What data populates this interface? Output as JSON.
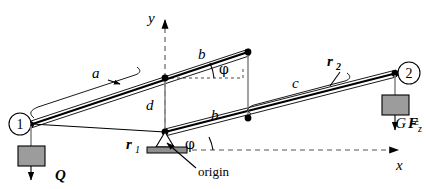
{
  "figure": {
    "axes": {
      "y_label": "y",
      "x_label": "x",
      "origin_label": "origin"
    },
    "nodes": [
      {
        "id": "node-1",
        "label": "1",
        "x": 24,
        "y": 124
      },
      {
        "id": "node-2",
        "label": "2",
        "x": 404,
        "y": 73
      }
    ],
    "lengths": {
      "a": "a",
      "b_upper": "b",
      "b_lower": "b",
      "c": "c",
      "d": "d"
    },
    "vectors": {
      "r1": "r",
      "r1_sub": "1",
      "r2": "r",
      "r2_sub": "2"
    },
    "angles": {
      "phi_upper": "φ",
      "phi_lower": "φ"
    },
    "forces": {
      "Q": "Q",
      "G_eq": "G =",
      "G_force": "F",
      "G_force_sub": "z"
    },
    "colors": {
      "stroke": "#000000",
      "mass_fill": "#9c9c9c",
      "gray_member": "#8a8a8a",
      "axis_dash": "#555555",
      "background": "#ffffff"
    }
  }
}
